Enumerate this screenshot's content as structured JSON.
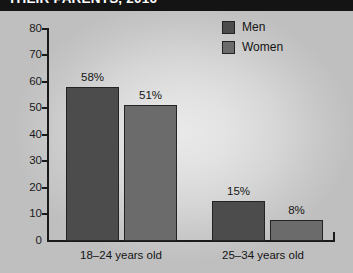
{
  "title": {
    "text": "THEIR PARENTS, 2016",
    "clipped": true
  },
  "legend": {
    "position": "top-right",
    "entries": [
      {
        "label": "Men",
        "color": "#4c4c4c",
        "key": "men"
      },
      {
        "label": "Women",
        "color": "#6b6b6b",
        "key": "women"
      }
    ]
  },
  "axis": {
    "y_ticks": [
      "80",
      "70",
      "60",
      "50",
      "40",
      "30",
      "20",
      "10",
      "0"
    ]
  },
  "chart_data": {
    "type": "bar",
    "title": "THEIR PARENTS, 2016",
    "xlabel": "",
    "ylabel": "",
    "ylim": [
      0,
      80
    ],
    "ytick_step": 10,
    "grid": false,
    "legend_position": "top-right",
    "categories": [
      "18–24 years old",
      "25–34 years old"
    ],
    "series": [
      {
        "name": "Men",
        "color": "#4c4c4c",
        "values": [
          58,
          51
        ]
      },
      {
        "name": "Women",
        "color": "#6b6b6b",
        "values": [
          15,
          8
        ]
      }
    ],
    "bars": [
      {
        "group": "18–24 years old",
        "series": "Men",
        "value": 58,
        "label": "58%"
      },
      {
        "group": "18–24 years old",
        "series": "Women",
        "value": 51,
        "label": "51%"
      },
      {
        "group": "25–34 years old",
        "series": "Men",
        "value": 15,
        "label": "15%"
      },
      {
        "group": "25–34 years old",
        "series": "Women",
        "value": 8,
        "label": "8%"
      }
    ],
    "value_labels": [
      "58%",
      "51%",
      "15%",
      "8%"
    ]
  }
}
